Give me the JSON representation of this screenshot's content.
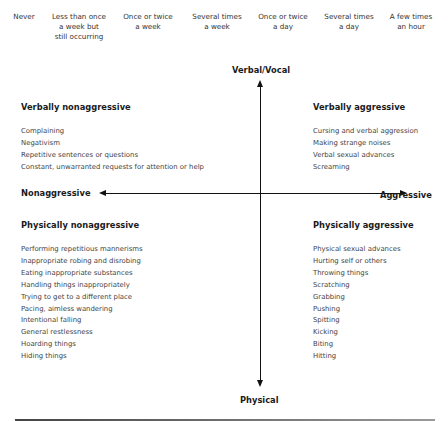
{
  "frequency_scale": [
    {
      "label": "Never"
    },
    {
      "label": "Less than once\na week but\nstill occurring"
    },
    {
      "label": "Once or twice\na week"
    },
    {
      "label": "Several times\na week"
    },
    {
      "label": "Once or twice\na day"
    },
    {
      "label": "Several times\na day"
    },
    {
      "label": "A few times\nan hour"
    }
  ],
  "axes": {
    "top": "Verbal/Vocal",
    "bottom": "Physical",
    "left": "Nonaggressive",
    "right": "Aggressive"
  },
  "quadrants": {
    "verbally_nonaggressive": {
      "title": "Verbally nonaggressive",
      "items": [
        "Complaining",
        "Negativism",
        "Repetitive sentences or questions",
        "Constant, unwarranted requests for attention or help"
      ]
    },
    "verbally_aggressive": {
      "title": "Verbally aggressive",
      "items": [
        "Cursing and verbal aggression",
        "Making strange noises",
        "Verbal sexual advances",
        "Screaming"
      ]
    },
    "physically_nonaggressive": {
      "title": "Physically nonaggressive",
      "items": [
        "Performing repetitious mannerisms",
        "Inappropriate robing and disrobing",
        "Eating inappropriate substances",
        "Handling things inappropriately",
        "Trying to get to a different place",
        "Pacing, aimless wandering",
        "Intentional falling",
        "General restlessness",
        "Hoarding things",
        "Hiding things"
      ]
    },
    "physically_aggressive": {
      "title": "Physically aggressive",
      "items": [
        "Physical sexual advances",
        "Hurting self or others",
        "Throwing things",
        "Scratching",
        "Grabbing",
        "Pushing",
        "Spitting",
        "Kicking",
        "Biting",
        "Hitting"
      ]
    }
  }
}
